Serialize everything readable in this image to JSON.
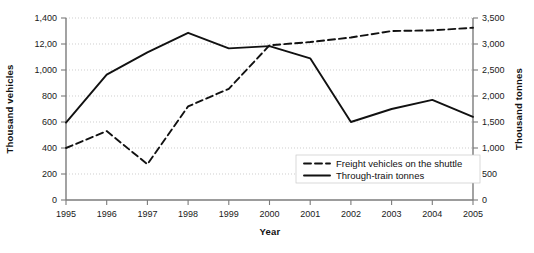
{
  "chart_data": {
    "type": "line",
    "title": "",
    "xlabel": "Year",
    "ylabel": "Thousand vehicles",
    "y2label": "Thousand tonnes",
    "grid": true,
    "legend_position": "inside-bottom-right",
    "x": [
      1995,
      1996,
      1997,
      1998,
      1999,
      2000,
      2001,
      2002,
      2003,
      2004,
      2005
    ],
    "categories": [
      "1995",
      "1996",
      "1997",
      "1998",
      "1999",
      "2000",
      "2001",
      "2002",
      "2003",
      "2004",
      "2005"
    ],
    "xlim": [
      1995,
      2005
    ],
    "ylim": [
      0,
      1400
    ],
    "y2lim": [
      0,
      3500
    ],
    "yticks": [
      0,
      200,
      400,
      600,
      800,
      1000,
      1200,
      1400
    ],
    "ytick_labels": [
      "0",
      "200",
      "400",
      "600",
      "800",
      "1,000",
      "12,00",
      "1,400"
    ],
    "y2ticks": [
      0,
      500,
      1000,
      1500,
      2000,
      2500,
      3000,
      3500
    ],
    "y2tick_labels": [
      "0",
      "500",
      "1,000",
      "1,500",
      "2,000",
      "2,500",
      "3,000",
      "3,500"
    ],
    "series": [
      {
        "name": "Freight vehicles on the shuttle",
        "axis": "left",
        "style": "dashed",
        "color": "#111111",
        "values": [
          400,
          530,
          275,
          720,
          855,
          1190,
          1215,
          1250,
          1300,
          1305,
          1325
        ]
      },
      {
        "name": "Through-train tonnes",
        "axis": "right",
        "style": "solid",
        "color": "#111111",
        "values_left_scale": [
          595,
          965,
          1135,
          1285,
          1165,
          1185,
          1090,
          600,
          700,
          770,
          640
        ],
        "values": [
          1490,
          2410,
          2840,
          3215,
          2915,
          2960,
          2725,
          1500,
          1750,
          1925,
          1600
        ]
      }
    ]
  },
  "axes": {
    "left_title": "Thousand vehicles",
    "right_title": "Thousand tonnes",
    "bottom_title": "Year"
  },
  "legend": {
    "items": [
      {
        "label": "Freight vehicles on the shuttle",
        "style": "dashed"
      },
      {
        "label": "Through-train tonnes",
        "style": "solid"
      }
    ]
  }
}
